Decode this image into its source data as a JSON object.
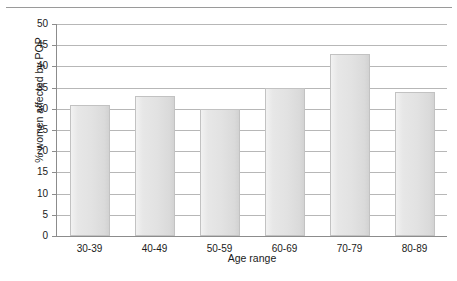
{
  "chart_data": {
    "type": "bar",
    "title": "",
    "subtitle": "",
    "xlabel": "Age range",
    "ylabel": "% women affected by POP",
    "categories": [
      "30-39",
      "40-49",
      "50-59",
      "60-69",
      "70-79",
      "80-89"
    ],
    "values": [
      31,
      33,
      30,
      35,
      43,
      34
    ],
    "series": [
      {
        "name": "% women affected by POP",
        "values": [
          31,
          33,
          30,
          35,
          43,
          34
        ]
      }
    ],
    "ylim": [
      0,
      50
    ],
    "ytick_step": 5,
    "ytick_labels": [
      "0",
      "5",
      "10",
      "15",
      "20",
      "25",
      "30",
      "35",
      "40",
      "45",
      "50"
    ],
    "ytick_values": [
      0,
      5,
      10,
      15,
      20,
      25,
      30,
      35,
      40,
      45,
      50
    ],
    "grid": "horizontal",
    "legend": "none",
    "annotations": [],
    "colors": {
      "bar_fill_light": "#f2f2f2",
      "bar_fill_dark": "#d2d2d2",
      "bar_border": "#c2c2c2",
      "gridline": "#b7b7b7",
      "axis": "#8c8c8c",
      "text": "#1a1a1a",
      "background": "#ffffff",
      "top_rule": "#9a9a9a"
    }
  }
}
